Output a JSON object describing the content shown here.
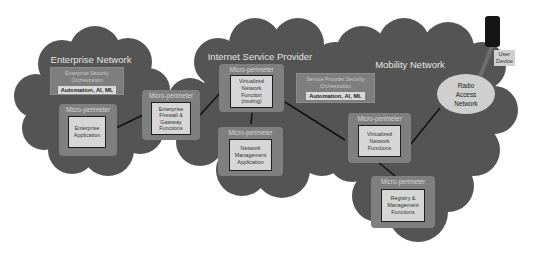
{
  "diagram": {
    "colors": {
      "cloud": "#545454",
      "micro_perimeter": "#7f7f7f",
      "function_box": "#d6d6d6",
      "connector": "#111111",
      "background": "#ffffff"
    },
    "enterprise": {
      "title": "Enterprise Network",
      "orchestration": {
        "line1": "Enterprise Security",
        "line2": "Orchestration",
        "tag": "Automation, AI, ML"
      },
      "app": {
        "perimeter_label": "Micro-perimeter",
        "line1": "Enterprise",
        "line2": "Application"
      }
    },
    "firewall": {
      "perimeter_label": "Micro-perimeter",
      "line1": "Enterprise",
      "line2": "Firewall &",
      "line3": "Gateway",
      "line4": "Functions"
    },
    "isp": {
      "title": "Internet Service Provider",
      "vnf": {
        "perimeter_label": "Micro-perimeter",
        "line1": "Virtualized",
        "line2": "Network",
        "line3": "Function",
        "line4": "(routing)"
      },
      "nma": {
        "perimeter_label": "Micro-perimeter",
        "line1": "Network",
        "line2": "Management",
        "line3": "Application"
      },
      "orchestration": {
        "line1": "Service Provider Security",
        "line2": "Orchestration",
        "tag": "Automation, AI, ML"
      }
    },
    "mobility": {
      "title": "Mobility Network",
      "ran": {
        "line1": "Radio",
        "line2": "Access",
        "line3": "Network"
      },
      "vnfs": {
        "perimeter_label": "Micro-perimeter",
        "line1": "Virtualized",
        "line2": "Network",
        "line3": "Functions"
      },
      "registry": {
        "perimeter_label": "Micro-perimeter",
        "line1": "Registry &",
        "line2": "Management",
        "line3": "Functions"
      }
    },
    "device": {
      "line1": "User",
      "line2": "Device"
    }
  }
}
